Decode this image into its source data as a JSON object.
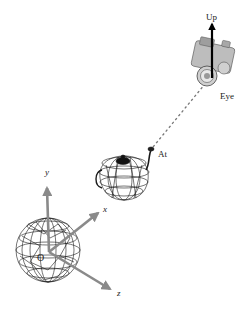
{
  "diagram": {
    "type": "camera-lookat",
    "labels": {
      "up": "Up",
      "eye": "Eye",
      "at": "At",
      "origin": "O",
      "x_axis": "x",
      "y_axis": "y",
      "z_axis": "z"
    },
    "objects": {
      "sphere": "wireframe-sphere",
      "teapot": "wireframe-teapot",
      "camera": "camera"
    },
    "colors": {
      "axis": "#8a8a8a",
      "wire": "#1a1a1a",
      "up_arrow": "#000000",
      "dashed_line": "#777777"
    }
  }
}
